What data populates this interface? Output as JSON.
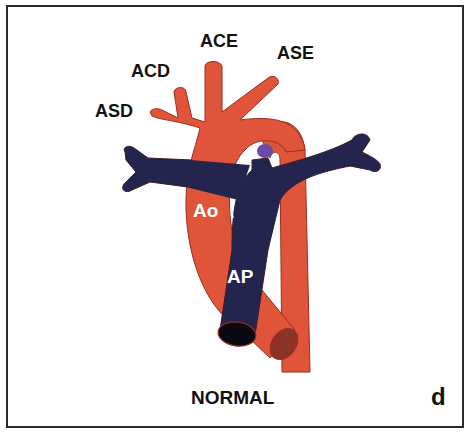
{
  "figure": {
    "caption": "NORMAL",
    "panel_letter": "d",
    "labels": {
      "ace": "ACE",
      "ase": "ASE",
      "acd": "ACD",
      "asd": "ASD",
      "ao": "Ao",
      "ap": "AP"
    },
    "colors": {
      "aorta": "#e0553a",
      "aorta_outline": "#9a2e22",
      "pulmonary": "#23254f",
      "ductus": "#6b4aa8",
      "aorta_cut": "#8a3326",
      "frame": "#2b2b2b",
      "background": "#ffffff"
    }
  }
}
